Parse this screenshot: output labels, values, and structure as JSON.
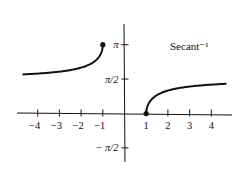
{
  "chart_data": {
    "type": "line",
    "title": "Secant⁻¹",
    "xlabel": "",
    "ylabel": "",
    "xlim": [
      -4.9,
      5.0
    ],
    "ylim": [
      -2.2,
      3.6
    ],
    "grid": false,
    "x_ticks": [
      -4,
      -3,
      -2,
      -1,
      1,
      2,
      3,
      4
    ],
    "x_tick_labels": [
      "−4",
      "−3",
      "−2",
      "−1",
      "1",
      "2",
      "3",
      "4"
    ],
    "y_ticks": [
      3.14159,
      1.5708,
      -1.5708
    ],
    "y_tick_labels": [
      "π",
      "π/2",
      "− π/2"
    ],
    "series": [
      {
        "name": "arcsec (x ≤ −1)",
        "x_range": [
          -4.7,
          -1
        ],
        "endpoint": {
          "x": -1,
          "y": 3.14159,
          "filled": true
        }
      },
      {
        "name": "arcsec (x ≥ 1)",
        "x_range": [
          1,
          4.7
        ],
        "endpoint": {
          "x": 1,
          "y": 0,
          "filled": true
        }
      }
    ]
  }
}
